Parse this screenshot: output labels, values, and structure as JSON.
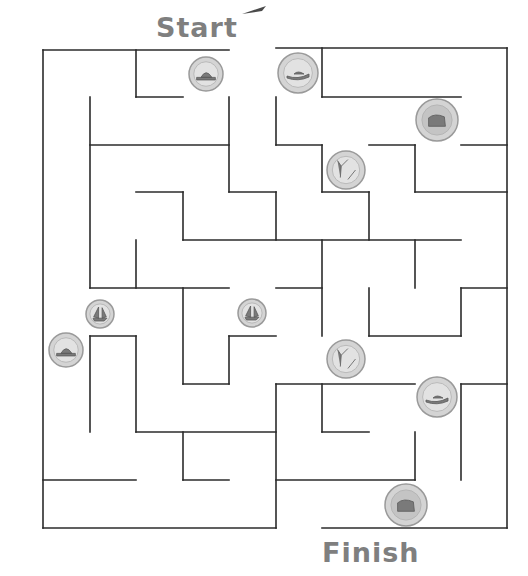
{
  "labels": {
    "start": "Start",
    "finish": "Finish"
  },
  "colors": {
    "wall": "#2b2b2b",
    "label": "#7f7f7f",
    "coin_face": "#d4d4d4",
    "coin_rim": "#9a9a9a"
  },
  "maze": {
    "walls": [
      [
        43,
        50,
        229,
        50
      ],
      [
        276,
        48,
        507,
        48
      ],
      [
        43,
        50,
        43,
        528
      ],
      [
        507,
        48,
        507,
        528
      ],
      [
        43,
        528,
        276,
        528
      ],
      [
        322,
        528,
        507,
        528
      ],
      [
        136,
        50,
        136,
        97
      ],
      [
        136,
        97,
        183,
        97
      ],
      [
        90,
        97,
        90,
        288
      ],
      [
        90,
        145,
        229,
        145
      ],
      [
        229,
        97,
        229,
        192
      ],
      [
        229,
        192,
        276,
        192
      ],
      [
        276,
        192,
        276,
        240
      ],
      [
        276,
        97,
        276,
        145
      ],
      [
        276,
        145,
        322,
        145
      ],
      [
        322,
        145,
        322,
        192
      ],
      [
        322,
        192,
        369,
        192
      ],
      [
        369,
        192,
        369,
        240
      ],
      [
        322,
        48,
        322,
        97
      ],
      [
        322,
        97,
        461,
        97
      ],
      [
        369,
        145,
        415,
        145
      ],
      [
        415,
        145,
        415,
        192
      ],
      [
        415,
        192,
        507,
        192
      ],
      [
        461,
        145,
        507,
        145
      ],
      [
        136,
        192,
        183,
        192
      ],
      [
        183,
        192,
        183,
        240
      ],
      [
        183,
        240,
        461,
        240
      ],
      [
        136,
        240,
        136,
        288
      ],
      [
        90,
        288,
        229,
        288
      ],
      [
        183,
        288,
        183,
        384
      ],
      [
        183,
        384,
        229,
        384
      ],
      [
        229,
        336,
        229,
        384
      ],
      [
        229,
        336,
        276,
        336
      ],
      [
        276,
        288,
        322,
        288
      ],
      [
        322,
        240,
        322,
        336
      ],
      [
        415,
        240,
        415,
        288
      ],
      [
        369,
        288,
        369,
        336
      ],
      [
        369,
        336,
        461,
        336
      ],
      [
        461,
        288,
        461,
        336
      ],
      [
        461,
        288,
        507,
        288
      ],
      [
        90,
        336,
        90,
        432
      ],
      [
        90,
        336,
        136,
        336
      ],
      [
        136,
        336,
        136,
        432
      ],
      [
        136,
        432,
        276,
        432
      ],
      [
        183,
        432,
        183,
        480
      ],
      [
        183,
        480,
        229,
        480
      ],
      [
        43,
        480,
        136,
        480
      ],
      [
        276,
        384,
        276,
        528
      ],
      [
        276,
        384,
        415,
        384
      ],
      [
        322,
        384,
        322,
        432
      ],
      [
        322,
        432,
        369,
        432
      ],
      [
        415,
        432,
        415,
        480
      ],
      [
        276,
        480,
        415,
        480
      ],
      [
        461,
        384,
        507,
        384
      ],
      [
        461,
        384,
        461,
        480
      ]
    ],
    "coins": [
      {
        "name": "nickel-beaver",
        "cx": 206,
        "cy": 74,
        "r": 17,
        "type": "nickel"
      },
      {
        "name": "loonie-loon",
        "cx": 298,
        "cy": 73,
        "r": 20,
        "type": "loonie"
      },
      {
        "name": "toonie-bear",
        "cx": 437,
        "cy": 120,
        "r": 21,
        "type": "toonie"
      },
      {
        "name": "quarter-caribou",
        "cx": 346,
        "cy": 170,
        "r": 19,
        "type": "quarter"
      },
      {
        "name": "dime-bluenose",
        "cx": 100,
        "cy": 314,
        "r": 14,
        "type": "dime"
      },
      {
        "name": "dime-bluenose-2",
        "cx": 252,
        "cy": 313,
        "r": 14,
        "type": "dime"
      },
      {
        "name": "nickel-beaver-2",
        "cx": 66,
        "cy": 350,
        "r": 17,
        "type": "nickel"
      },
      {
        "name": "quarter-caribou-2",
        "cx": 346,
        "cy": 359,
        "r": 19,
        "type": "quarter"
      },
      {
        "name": "loonie-loon-2",
        "cx": 437,
        "cy": 397,
        "r": 20,
        "type": "loonie"
      },
      {
        "name": "toonie-bear-2",
        "cx": 406,
        "cy": 505,
        "r": 21,
        "type": "toonie"
      }
    ]
  }
}
